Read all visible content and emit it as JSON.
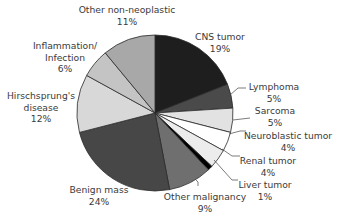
{
  "chart_data": {
    "type": "pie",
    "title": "",
    "start_angle_deg": 0,
    "direction": "clockwise",
    "center": [
      155,
      113
    ],
    "radius": 78,
    "slices": [
      {
        "label": "CNS tumor",
        "value": 19,
        "pct_label": "19%",
        "color": "#1e1e1e"
      },
      {
        "label": "Lymphoma",
        "value": 5,
        "pct_label": "5%",
        "color": "#4a4a4a"
      },
      {
        "label": "Sarcoma",
        "value": 5,
        "pct_label": "5%",
        "color": "#e2e2e2"
      },
      {
        "label": "Neuroblastic tumor",
        "value": 4,
        "pct_label": "4%",
        "color": "#ffffff"
      },
      {
        "label": "Renal tumor",
        "value": 4,
        "pct_label": "4%",
        "color": "#ececec"
      },
      {
        "label": "Liver tumor",
        "value": 1,
        "pct_label": "1%",
        "color": "#000000"
      },
      {
        "label": "Other malignancy",
        "value": 9,
        "pct_label": "9%",
        "color": "#6f6f6f"
      },
      {
        "label": "Benign mass",
        "value": 24,
        "pct_label": "24%",
        "color": "#474747"
      },
      {
        "label": "Hirschsprung's disease",
        "value": 12,
        "pct_label": "12%",
        "color": "#d8d8d8"
      },
      {
        "label": "Inflammation/ Infection",
        "value": 6,
        "pct_label": "6%",
        "color": "#c4c4c4"
      },
      {
        "label": "Other non-neoplastic",
        "value": 11,
        "pct_label": "11%",
        "color": "#a8a8a8"
      }
    ],
    "legend": "none (direct labels with leader lines)"
  },
  "labels": {
    "cns": {
      "name": "CNS tumor",
      "pct": "19%"
    },
    "lymphoma": {
      "name": "Lymphoma",
      "pct": "5%"
    },
    "sarcoma": {
      "name": "Sarcoma",
      "pct": "5%"
    },
    "neuro": {
      "name": "Neuroblastic tumor",
      "pct": "4%"
    },
    "renal": {
      "name": "Renal tumor",
      "pct": "4%"
    },
    "liver": {
      "name": "Liver tumor",
      "pct": "1%"
    },
    "other_malig": {
      "name": "Other malignancy",
      "pct": "9%"
    },
    "benign": {
      "name": "Benign mass",
      "pct": "24%"
    },
    "hirsch": {
      "line1": "Hirschsprung's",
      "line2": "disease",
      "pct": "12%"
    },
    "inflam": {
      "line1": "Inflammation/",
      "line2": "Infection",
      "pct": "6%"
    },
    "other_non": {
      "name": "Other non-neoplastic",
      "pct": "11%"
    }
  }
}
